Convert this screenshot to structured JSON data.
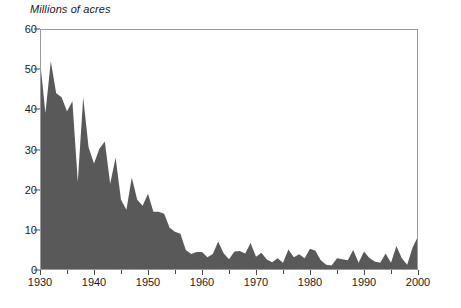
{
  "chart_data": {
    "type": "area",
    "title": "Millions of acres",
    "xlabel": "",
    "ylabel": "Millions of acres",
    "xlim": [
      1930,
      2000
    ],
    "ylim": [
      0,
      60
    ],
    "grid": false,
    "legend": "none",
    "fill_color": "#595959",
    "frame_color": "#9a9a9a",
    "ytick_values": [
      0,
      10,
      20,
      30,
      40,
      50,
      60
    ],
    "ytick_labels": [
      "0",
      "10",
      "20",
      "30",
      "40",
      "50",
      "60"
    ],
    "xtick_values": [
      1930,
      1940,
      1950,
      1960,
      1970,
      1980,
      1990,
      2000
    ],
    "xtick_labels": [
      "1930",
      "1940",
      "1950",
      "1960",
      "1970",
      "1980",
      "1990",
      "2000"
    ],
    "xtick_minor_values": [
      1935,
      1945,
      1955,
      1965,
      1975,
      1985,
      1995
    ],
    "x": [
      1930,
      1931,
      1932,
      1933,
      1934,
      1935,
      1936,
      1937,
      1938,
      1939,
      1940,
      1941,
      1942,
      1943,
      1944,
      1945,
      1946,
      1947,
      1948,
      1949,
      1950,
      1951,
      1952,
      1953,
      1954,
      1955,
      1956,
      1957,
      1958,
      1959,
      1960,
      1961,
      1962,
      1963,
      1964,
      1965,
      1966,
      1967,
      1968,
      1969,
      1970,
      1971,
      1972,
      1973,
      1974,
      1975,
      1976,
      1977,
      1978,
      1979,
      1980,
      1981,
      1982,
      1983,
      1984,
      1985,
      1986,
      1987,
      1988,
      1989,
      1990,
      1991,
      1992,
      1993,
      1994,
      1995,
      1996,
      1997,
      1998,
      1999,
      2000
    ],
    "values": [
      52.3,
      39.1,
      52.0,
      44.0,
      43.0,
      39.5,
      42.0,
      22.0,
      43.0,
      30.5,
      26.5,
      30.2,
      32.0,
      21.5,
      28.0,
      17.5,
      15.0,
      23.0,
      17.5,
      16.0,
      19.0,
      14.5,
      14.5,
      14.0,
      10.5,
      9.5,
      9.0,
      5.0,
      4.0,
      4.5,
      4.5,
      3.2,
      4.0,
      7.1,
      4.2,
      2.7,
      4.6,
      4.7,
      4.1,
      6.7,
      3.3,
      4.3,
      2.6,
      1.9,
      2.9,
      1.8,
      5.1,
      3.2,
      3.9,
      2.9,
      5.3,
      4.8,
      2.4,
      1.3,
      1.1,
      2.9,
      2.7,
      2.4,
      5.0,
      1.8,
      4.6,
      3.0,
      2.1,
      1.8,
      4.1,
      1.8,
      6.0,
      2.9,
      1.3,
      5.6,
      8.4
    ],
    "series": [
      {
        "name": "Acres burned",
        "values": [
          52.3,
          39.1,
          52.0,
          44.0,
          43.0,
          39.5,
          42.0,
          22.0,
          43.0,
          30.5,
          26.5,
          30.2,
          32.0,
          21.5,
          28.0,
          17.5,
          15.0,
          23.0,
          17.5,
          16.0,
          19.0,
          14.5,
          14.5,
          14.0,
          10.5,
          9.5,
          9.0,
          5.0,
          4.0,
          4.5,
          4.5,
          3.2,
          4.0,
          7.1,
          4.2,
          2.7,
          4.6,
          4.7,
          4.1,
          6.7,
          3.3,
          4.3,
          2.6,
          1.9,
          2.9,
          1.8,
          5.1,
          3.2,
          3.9,
          2.9,
          5.3,
          4.8,
          2.4,
          1.3,
          1.1,
          2.9,
          2.7,
          2.4,
          5.0,
          1.8,
          4.6,
          3.0,
          2.1,
          1.8,
          4.1,
          1.8,
          6.0,
          2.9,
          1.3,
          5.6,
          8.4
        ]
      }
    ]
  }
}
